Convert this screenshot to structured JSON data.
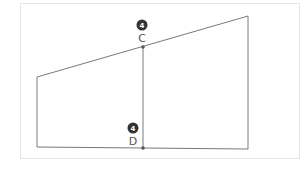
{
  "diagram": {
    "points": [
      {
        "id": "C",
        "label": "C",
        "badge": "4"
      },
      {
        "id": "D",
        "label": "D",
        "badge": "4"
      }
    ]
  }
}
